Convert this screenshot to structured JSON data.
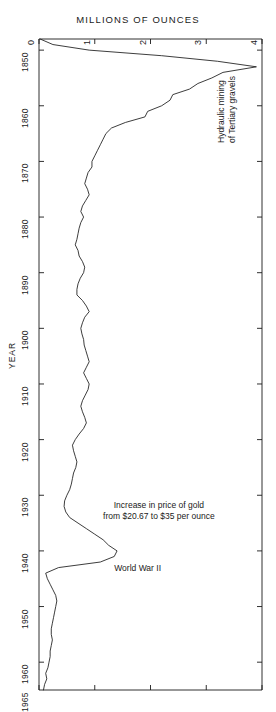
{
  "figure": {
    "title": "MILLIONS OF OUNCES",
    "year_axis_name": "YEAR",
    "background": "#ffffff",
    "line_color": "#1a1a1a"
  },
  "annotations": [
    {
      "name": "hydraulic-mining-annotation",
      "lines": [
        "Hydraulic mining",
        "of Tertiary gravels"
      ],
      "orientation": "vertical",
      "year": 1854
    },
    {
      "name": "gold-price-annotation",
      "lines": [
        "Increase in price of gold",
        "from $20.67 to $35 per ounce"
      ],
      "orientation": "horizontal",
      "year": 1934
    },
    {
      "name": "world-war-two-annotation",
      "lines": [
        "World War II"
      ],
      "orientation": "horizontal",
      "year": 1942
    }
  ],
  "chart_data": {
    "type": "line",
    "title": "MILLIONS OF OUNCES",
    "xlabel": "MILLIONS OF OUNCES",
    "ylabel": "YEAR",
    "orientation": "year-vertical-descending",
    "grid": false,
    "legend": null,
    "xlim": [
      0,
      4
    ],
    "ylim": [
      1848,
      1965
    ],
    "xticks": [
      0,
      1,
      2,
      3,
      4
    ],
    "xtick_labels": [
      "0",
      "1",
      "2",
      "3",
      "4"
    ],
    "yticks": [
      1850,
      1860,
      1870,
      1880,
      1890,
      1900,
      1910,
      1920,
      1930,
      1940,
      1950,
      1960,
      1965
    ],
    "ytick_labels": [
      "1850",
      "1860",
      "1870",
      "1880",
      "1890",
      "1900",
      "1910",
      "1920",
      "1930",
      "1940",
      "1950",
      "1960",
      "1965"
    ],
    "x": [
      1848,
      1849,
      1850,
      1851,
      1852,
      1853,
      1854,
      1855,
      1856,
      1857,
      1858,
      1859,
      1860,
      1861,
      1862,
      1863,
      1864,
      1865,
      1866,
      1867,
      1868,
      1869,
      1870,
      1871,
      1872,
      1873,
      1874,
      1875,
      1876,
      1877,
      1878,
      1879,
      1880,
      1881,
      1882,
      1883,
      1884,
      1885,
      1886,
      1887,
      1888,
      1889,
      1890,
      1891,
      1892,
      1893,
      1894,
      1895,
      1896,
      1897,
      1898,
      1899,
      1900,
      1901,
      1902,
      1903,
      1904,
      1905,
      1906,
      1907,
      1908,
      1909,
      1910,
      1911,
      1912,
      1913,
      1914,
      1915,
      1916,
      1917,
      1918,
      1919,
      1920,
      1921,
      1922,
      1923,
      1924,
      1925,
      1926,
      1927,
      1928,
      1929,
      1930,
      1931,
      1932,
      1933,
      1934,
      1935,
      1936,
      1937,
      1938,
      1939,
      1940,
      1941,
      1942,
      1943,
      1944,
      1945,
      1946,
      1947,
      1948,
      1949,
      1950,
      1951,
      1952,
      1953,
      1954,
      1955,
      1956,
      1957,
      1958,
      1959,
      1960,
      1961,
      1962,
      1963,
      1964,
      1965
    ],
    "y": [
      0.02,
      0.25,
      0.9,
      2.2,
      3.2,
      3.9,
      3.3,
      3.1,
      2.85,
      2.7,
      2.4,
      2.35,
      2.2,
      1.95,
      1.9,
      1.55,
      1.3,
      1.2,
      1.15,
      1.1,
      1.05,
      1.0,
      0.95,
      0.95,
      0.88,
      0.85,
      0.82,
      0.87,
      0.9,
      0.84,
      0.78,
      0.75,
      0.8,
      0.75,
      0.72,
      0.7,
      0.68,
      0.65,
      0.7,
      0.72,
      0.78,
      0.82,
      0.8,
      0.74,
      0.7,
      0.68,
      0.68,
      0.78,
      0.85,
      0.9,
      0.82,
      0.78,
      0.75,
      0.77,
      0.8,
      0.81,
      0.84,
      0.87,
      0.9,
      0.85,
      0.8,
      0.85,
      0.9,
      0.88,
      0.83,
      0.78,
      0.75,
      0.78,
      0.82,
      0.85,
      0.8,
      0.72,
      0.65,
      0.6,
      0.62,
      0.65,
      0.68,
      0.66,
      0.62,
      0.6,
      0.58,
      0.55,
      0.5,
      0.46,
      0.45,
      0.48,
      0.55,
      0.7,
      0.85,
      1.0,
      1.15,
      1.25,
      1.4,
      1.35,
      1.1,
      0.35,
      0.12,
      0.15,
      0.2,
      0.25,
      0.3,
      0.32,
      0.3,
      0.28,
      0.26,
      0.24,
      0.22,
      0.22,
      0.24,
      0.22,
      0.2,
      0.2,
      0.18,
      0.16,
      0.12,
      0.14,
      0.1,
      0.08,
      0.06,
      0.05
    ]
  }
}
